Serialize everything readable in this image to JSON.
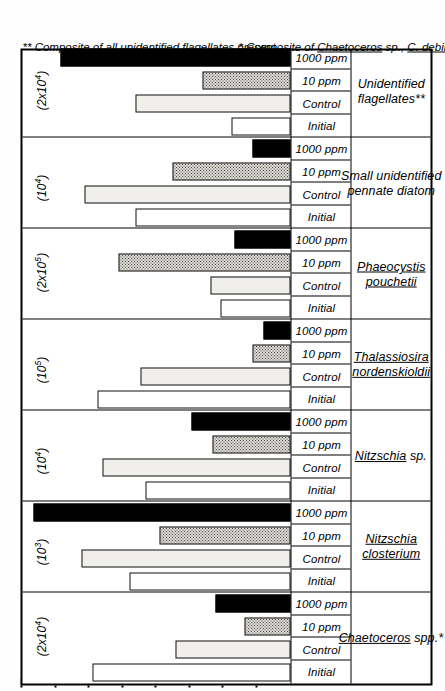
{
  "chart_data": {
    "type": "bar",
    "title": "",
    "xlabel": "",
    "ylabel": "",
    "orientation": "vertical",
    "grid": false,
    "legend_position": "none",
    "treatments": [
      "Initial",
      "Control",
      "10 ppm",
      "1000 ppm"
    ],
    "note": "Each species panel is plotted on its own vertical scale, shown in parentheses as cells per litre full-scale.",
    "panels": [
      {
        "species": "Chaetoceros spp.*",
        "species_lines": [
          "Chaetoceros  spp.*"
        ],
        "scale_label": "(2x10⁴)",
        "scale_value": 20000,
        "categories": [
          "Initial",
          "Control",
          "10 ppm",
          "1000 ppm"
        ],
        "values": [
          0.74,
          0.43,
          0.17,
          0.28
        ],
        "fills": [
          "white",
          "light",
          "dotted",
          "black"
        ]
      },
      {
        "species": "Nitzschia closterium",
        "species_lines": [
          "Nitzschia",
          "closterium"
        ],
        "scale_label": "(10³)",
        "scale_value": 1000,
        "categories": [
          "Initial",
          "Control",
          "10 ppm",
          "1000 ppm"
        ],
        "values": [
          0.6,
          0.78,
          0.49,
          0.96
        ],
        "fills": [
          "white",
          "light",
          "dotted",
          "black"
        ]
      },
      {
        "species": "Nitzschia sp.",
        "species_lines": [
          "Nitzschia  sp."
        ],
        "scale_label": "(10⁴)",
        "scale_value": 10000,
        "categories": [
          "Initial",
          "Control",
          "10 ppm",
          "1000 ppm"
        ],
        "values": [
          0.54,
          0.7,
          0.29,
          0.37
        ],
        "fills": [
          "white",
          "light",
          "dotted",
          "black"
        ]
      },
      {
        "species": "Thalassiosira nordenskioldii",
        "species_lines": [
          "Thalassiosira",
          "nordenskioldii"
        ],
        "scale_label": "(10⁵)",
        "scale_value": 100000,
        "categories": [
          "Initial",
          "Control",
          "10 ppm",
          "1000 ppm"
        ],
        "values": [
          0.72,
          0.56,
          0.14,
          0.1
        ],
        "fills": [
          "white",
          "light",
          "dotted",
          "black"
        ]
      },
      {
        "species": "Phaeocystis pouchetii",
        "species_lines": [
          "Phaeocystis",
          "pouchetii"
        ],
        "scale_label": "(2x10⁵)",
        "scale_value": 200000,
        "categories": [
          "Initial",
          "Control",
          "10 ppm",
          "1000 ppm"
        ],
        "values": [
          0.26,
          0.3,
          0.64,
          0.21
        ],
        "fills": [
          "white",
          "light",
          "dotted",
          "black"
        ]
      },
      {
        "species": "Small unidentified pennate diatom",
        "species_lines": [
          "Small unidentified",
          "pennate  diatom"
        ],
        "scale_label": "(10⁴)",
        "scale_value": 10000,
        "categories": [
          "Initial",
          "Control",
          "10 ppm",
          "1000 ppm"
        ],
        "values": [
          0.58,
          0.77,
          0.44,
          0.14
        ],
        "fills": [
          "white",
          "light",
          "dotted",
          "black"
        ]
      },
      {
        "species": "Unidentified flagellates**",
        "species_lines": [
          "Unidentified",
          "flagellates**"
        ],
        "scale_label": "(2x10⁴)",
        "scale_value": 20000,
        "categories": [
          "Initial",
          "Control",
          "10 ppm",
          "1000 ppm"
        ],
        "values": [
          0.22,
          0.58,
          0.33,
          0.86
        ],
        "fills": [
          "white",
          "light",
          "dotted",
          "black"
        ]
      }
    ],
    "axis_ticks": [
      0.125,
      0.25,
      0.375,
      0.5,
      0.625,
      0.75,
      0.875,
      1.0
    ],
    "ylim": [
      0,
      1
    ]
  },
  "footnotes": {
    "single_star": "* Composite of Chaetoceros sp., C. debilis and C. convolutus",
    "single_star_parts": {
      "prefix": "* Composite of ",
      "t1": "Chaetoceros",
      "mid1": " sp., ",
      "t2": "C. debilis",
      "mid2": " and ",
      "t3": "C. convolutus"
    },
    "double_star": "** Composite of all unidentified flagellates present"
  },
  "colors": {
    "ink": "#000000",
    "paper": "#ffffff",
    "light_fill": "#f0efec",
    "dotted_fill": "#dedbd6",
    "solid_fill": "#000000"
  }
}
